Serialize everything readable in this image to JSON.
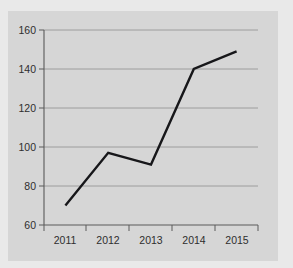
{
  "chart_data": {
    "type": "line",
    "title": "",
    "subtitle": "",
    "xlabel": "",
    "ylabel": "",
    "categories": [
      "2011",
      "2012",
      "2013",
      "2014",
      "2015"
    ],
    "values": [
      70,
      97,
      91,
      140,
      149
    ],
    "series": [
      {
        "name": "",
        "values": [
          70,
          97,
          91,
          140,
          149
        ]
      }
    ],
    "ylim": [
      60,
      160
    ],
    "yticks": [
      60,
      80,
      100,
      120,
      140,
      160
    ],
    "ytick_labels": [
      "60",
      "80",
      "100",
      "120",
      "140",
      "160"
    ],
    "xtick_labels": [
      "2011",
      "2012",
      "2013",
      "2014",
      "2015"
    ],
    "grid": true,
    "grid_axis": "y",
    "legend": false,
    "legend_position": "none",
    "markers": false,
    "line_color": "#17171a",
    "grid_color": "#8f8f8f",
    "axis_color": "#5a5a5a",
    "plot_background": "#d6d6d6",
    "figure_background": "#d6d6d6",
    "page_background": "#e9e9e9",
    "annotations": []
  },
  "axis": {
    "y_labels": [
      "160",
      "140",
      "120",
      "100",
      "80",
      "60"
    ],
    "x_labels": [
      "2011",
      "2012",
      "2013",
      "2014",
      "2015"
    ]
  }
}
